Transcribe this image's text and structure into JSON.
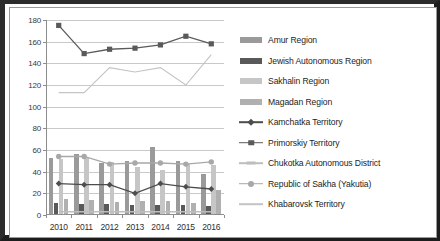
{
  "chart_data": {
    "type": "bar",
    "title": "",
    "xlabel": "",
    "ylabel": "",
    "ylim": [
      0,
      180
    ],
    "ytick_values": [
      0,
      20,
      40,
      60,
      80,
      100,
      120,
      140,
      160,
      180
    ],
    "grid": true,
    "legend_position": "right",
    "categories": [
      "2010",
      "2011",
      "2012",
      "2013",
      "2014",
      "2015",
      "2016"
    ],
    "series": [
      {
        "name": "Amur Region",
        "kind": "bar",
        "color": "#9a9a9a",
        "values": [
          52,
          55,
          47,
          49,
          62,
          49,
          37
        ]
      },
      {
        "name": "Jewish Autonomous Region",
        "kind": "bar",
        "color": "#595959",
        "values": [
          10,
          9,
          9,
          8,
          8,
          8,
          7
        ]
      },
      {
        "name": "Sakhalin Region",
        "kind": "bar",
        "color": "#c6c6c6",
        "values": [
          51,
          52,
          48,
          43,
          41,
          46,
          45
        ]
      },
      {
        "name": "Magadan Region",
        "kind": "bar",
        "color": "#b0b0b0",
        "values": [
          14,
          13,
          11,
          12,
          12,
          10,
          22
        ]
      },
      {
        "name": "Kamchatka Territory",
        "kind": "line",
        "marker": "diamond",
        "color": "#4d4d4d",
        "values": [
          29,
          28,
          28,
          20,
          29,
          26,
          24
        ]
      },
      {
        "name": "Primorskiy Territory",
        "kind": "line",
        "marker": "square",
        "color": "#5a5a5a",
        "values": [
          175,
          149,
          153,
          154,
          157,
          165,
          158
        ]
      },
      {
        "name": "Chukotka Autonomous District",
        "kind": "line",
        "marker": "dash",
        "color": "#bdbdbd",
        "values": [
          3,
          3,
          3,
          3,
          3,
          3,
          3
        ]
      },
      {
        "name": "Republic of Sakha (Yakutia)",
        "kind": "line",
        "marker": "circle",
        "color": "#a8a8a8",
        "values": [
          54,
          54,
          47,
          48,
          48,
          47,
          49
        ]
      },
      {
        "name": "Khabarovsk Territory",
        "kind": "line",
        "marker": "none",
        "color": "#c4c4c4",
        "values": [
          113,
          113,
          136,
          132,
          136,
          120,
          148
        ]
      }
    ]
  }
}
